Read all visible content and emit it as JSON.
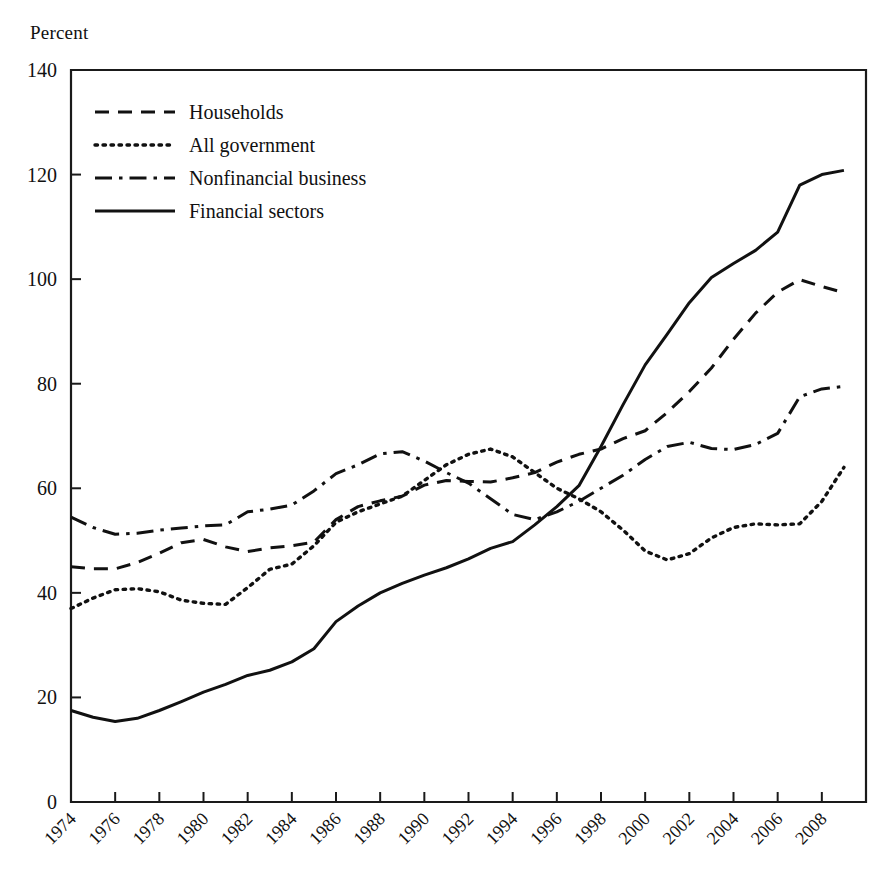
{
  "chart_data": {
    "type": "line",
    "title": "",
    "subtitle": "",
    "xlabel": "",
    "ylabel": "Percent",
    "ylim": [
      0,
      140
    ],
    "xlim": [
      1974,
      2010
    ],
    "ytick_step": 20,
    "yticks": [
      0,
      20,
      40,
      60,
      80,
      100,
      120,
      140
    ],
    "xticks": [
      1974,
      1976,
      1978,
      1980,
      1982,
      1984,
      1986,
      1988,
      1990,
      1992,
      1994,
      1996,
      1998,
      2000,
      2002,
      2004,
      2006,
      2008
    ],
    "xtick_labels": [
      "1974",
      "1976",
      "1978",
      "1980",
      "1982",
      "1984",
      "1986",
      "1988",
      "1990",
      "1992",
      "1994",
      "1996",
      "1998",
      "2000",
      "2002",
      "2004",
      "2006",
      "2008"
    ],
    "grid": false,
    "legend_position": "top-left inside plot",
    "x": [
      1974,
      1975,
      1976,
      1977,
      1978,
      1979,
      1980,
      1981,
      1982,
      1983,
      1984,
      1985,
      1986,
      1987,
      1988,
      1989,
      1990,
      1991,
      1992,
      1993,
      1994,
      1995,
      1996,
      1997,
      1998,
      1999,
      2000,
      2001,
      2002,
      2003,
      2004,
      2005,
      2006,
      2007,
      2008,
      2009
    ],
    "series": [
      {
        "name": "Households",
        "dash": "dashed",
        "values": [
          45.0,
          44.6,
          44.6,
          45.8,
          47.6,
          49.6,
          50.2,
          48.8,
          47.9,
          48.6,
          49.0,
          49.7,
          54.0,
          56.5,
          57.6,
          58.5,
          60.6,
          61.5,
          61.3,
          61.2,
          62.0,
          63.0,
          65.0,
          66.5,
          67.5,
          69.5,
          71.0,
          74.5,
          78.5,
          83.0,
          88.5,
          93.5,
          97.5,
          99.9,
          98.6,
          97.4
        ]
      },
      {
        "name": "All government",
        "dash": "dotted",
        "values": [
          37.0,
          39.0,
          40.6,
          40.8,
          40.2,
          38.6,
          38.0,
          37.8,
          41.0,
          44.5,
          45.5,
          49.0,
          53.5,
          55.5,
          57.0,
          58.5,
          61.5,
          64.5,
          66.5,
          67.5,
          66.0,
          63.0,
          60.0,
          58.0,
          55.5,
          52.0,
          48.0,
          46.3,
          47.5,
          50.5,
          52.5,
          53.2,
          53.0,
          53.2,
          57.5,
          64.0
        ]
      },
      {
        "name": "Nonfinancial business",
        "dash": "dashdot",
        "values": [
          54.5,
          52.5,
          51.2,
          51.4,
          52.0,
          52.4,
          52.8,
          53.0,
          55.5,
          56.0,
          56.8,
          59.5,
          62.8,
          64.5,
          66.6,
          67.0,
          65.2,
          63.0,
          61.0,
          58.0,
          55.0,
          54.0,
          55.5,
          57.5,
          60.0,
          62.5,
          65.5,
          68.0,
          68.8,
          67.6,
          67.4,
          68.4,
          70.5,
          77.5,
          79.0,
          79.5
        ]
      },
      {
        "name": "Financial sectors",
        "dash": "solid",
        "values": [
          17.5,
          16.2,
          15.4,
          16.0,
          17.5,
          19.2,
          21.0,
          22.5,
          24.2,
          25.2,
          26.8,
          29.3,
          34.5,
          37.5,
          40.0,
          41.8,
          43.4,
          44.8,
          46.5,
          48.5,
          49.8,
          53.0,
          56.5,
          60.5,
          68.0,
          76.0,
          83.6,
          89.5,
          95.5,
          100.3,
          103.0,
          105.5,
          109.0,
          118.0,
          120.0,
          120.8
        ]
      }
    ]
  },
  "legend": {
    "items": [
      {
        "label": "Households",
        "dash": "dashed"
      },
      {
        "label": "All government",
        "dash": "dotted"
      },
      {
        "label": "Nonfinancial business",
        "dash": "dashdot"
      },
      {
        "label": "Financial sectors",
        "dash": "solid"
      }
    ]
  },
  "style": {
    "line_color": "#111111",
    "axis_color": "#1a1a1a",
    "background": "#ffffff"
  }
}
